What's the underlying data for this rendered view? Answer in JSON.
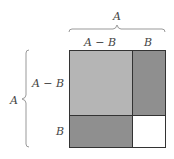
{
  "diagram": {
    "top_brace_label": "A",
    "left_brace_label": "A",
    "top_segment_labels": [
      "A − B",
      "B"
    ],
    "left_segment_labels": [
      "A − B",
      "B"
    ],
    "regions": [
      {
        "name": "large-square",
        "dims": "(A−B)×(A−B)",
        "color": "#b5b5b5"
      },
      {
        "name": "right-rectangle",
        "dims": "B×(A−B)",
        "color": "#8f8f8f"
      },
      {
        "name": "bottom-rectangle",
        "dims": "(A−B)×B",
        "color": "#8f8f8f"
      },
      {
        "name": "small-square",
        "dims": "B×B",
        "color": "#ffffff"
      }
    ],
    "colors": {
      "border": "#333333",
      "brace": "#999999",
      "text": "#444444"
    }
  }
}
